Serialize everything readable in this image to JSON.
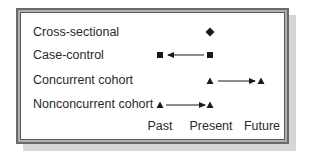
{
  "diagram": {
    "type": "study-design-timeline",
    "rows": [
      {
        "label": "Cross-sectional",
        "symbol": "diamond",
        "points": [
          "Present"
        ],
        "arrow": null
      },
      {
        "label": "Case-control",
        "symbol": "square",
        "points": [
          "Past",
          "Present"
        ],
        "arrow": {
          "from": "Present",
          "to": "Past"
        }
      },
      {
        "label": "Concurrent cohort",
        "symbol": "triangle",
        "points": [
          "Present",
          "Future"
        ],
        "arrow": {
          "from": "Present",
          "to": "Future"
        }
      },
      {
        "label": "Nonconcurrent cohort",
        "symbol": "triangle",
        "points": [
          "Past",
          "Present"
        ],
        "arrow": {
          "from": "Past",
          "to": "Present"
        }
      }
    ],
    "time_axis": [
      "Past",
      "Present",
      "Future"
    ],
    "colors": {
      "symbol": "#1a1a1a",
      "frame_outer": "#6a6a6a",
      "frame_mid": "#b0b0b0",
      "shadow": "#d6d6d6"
    }
  }
}
